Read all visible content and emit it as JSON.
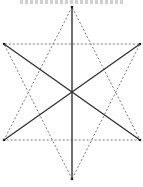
{
  "diagram": {
    "type": "hexagram",
    "colors": {
      "background": "#ffffff",
      "solid_line": "#333333",
      "dotted_line": "#777777"
    },
    "vertices": {
      "top": [
        72,
        7
      ],
      "upper_left": [
        4,
        44
      ],
      "upper_right": [
        140,
        44
      ],
      "lower_left": [
        4,
        140
      ],
      "lower_right": [
        140,
        140
      ],
      "bottom": [
        72,
        179
      ]
    },
    "center": [
      72,
      92
    ],
    "dotted_triangles": [
      [
        "top",
        "lower_left",
        "lower_right"
      ],
      [
        "bottom",
        "upper_left",
        "upper_right"
      ]
    ],
    "solid_diagonals": [
      [
        "top",
        "bottom"
      ],
      [
        "upper_left",
        "lower_right"
      ],
      [
        "upper_right",
        "lower_left"
      ]
    ]
  }
}
